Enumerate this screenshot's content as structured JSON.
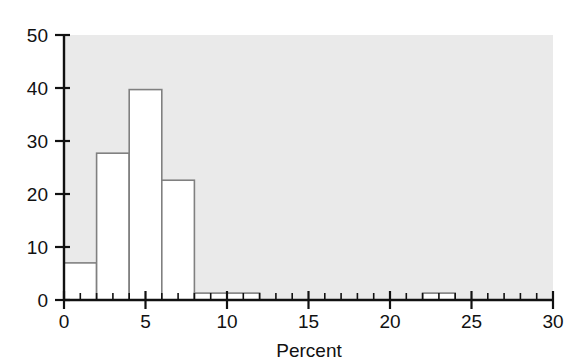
{
  "chart_data": {
    "type": "bar",
    "title": "",
    "subtitle": "",
    "xlabel": "Percent",
    "ylabel": "",
    "xlim": [
      0,
      30
    ],
    "ylim": [
      0,
      50
    ],
    "grid": false,
    "legend": null,
    "bin_width": 2,
    "bin_edges": [
      0,
      2,
      4,
      6,
      8,
      10,
      12,
      22,
      24
    ],
    "categories": [
      "0-2",
      "2-4",
      "4-6",
      "6-8",
      "8-10",
      "10-12",
      "22-24"
    ],
    "bins": [
      {
        "start": 0,
        "end": 2,
        "value": 7.0
      },
      {
        "start": 2,
        "end": 4,
        "value": 27.7
      },
      {
        "start": 4,
        "end": 6,
        "value": 39.7
      },
      {
        "start": 6,
        "end": 8,
        "value": 22.6
      },
      {
        "start": 8,
        "end": 10,
        "value": 1.3
      },
      {
        "start": 10,
        "end": 12,
        "value": 1.3
      },
      {
        "start": 22,
        "end": 24,
        "value": 1.3
      }
    ],
    "values": [
      7.0,
      27.7,
      39.7,
      22.6,
      1.3,
      1.3,
      1.3
    ],
    "x_ticks_major": [
      0,
      5,
      10,
      15,
      20,
      25,
      30
    ],
    "x_tick_labels": [
      "0",
      "5",
      "10",
      "15",
      "20",
      "25",
      "30"
    ],
    "x_ticks_minor_step": 1,
    "y_ticks": [
      0,
      10,
      20,
      30,
      40,
      50
    ],
    "y_tick_labels": [
      "0",
      "10",
      "20",
      "30",
      "40",
      "50"
    ],
    "colors": {
      "plot_background": "#eaeaea",
      "figure_background": "#ffffff",
      "bar_fill": "#ffffff",
      "bar_outline": "#808080",
      "axis_line": "#111111",
      "text": "#111111"
    }
  }
}
